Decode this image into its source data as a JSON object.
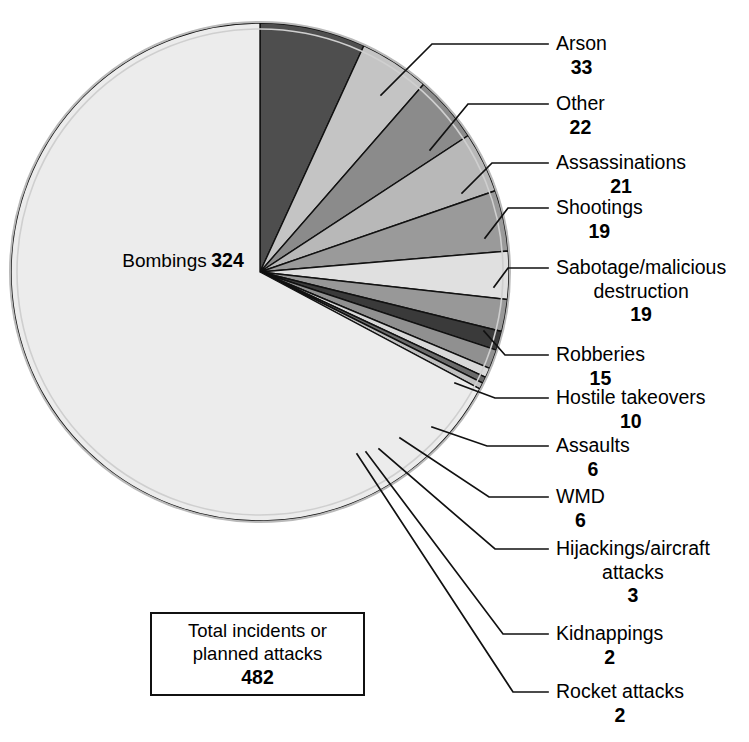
{
  "chart_data": {
    "type": "pie",
    "title": "",
    "total_label_line1": "Total incidents or",
    "total_label_line2": "planned attacks",
    "total_value": "482",
    "categories": [
      "Bombings",
      "Arson",
      "Other",
      "Assassinations",
      "Shootings",
      "Sabotage/malicious destruction",
      "Robberies",
      "Hostile takeovers",
      "Assaults",
      "WMD",
      "Hijackings/aircraft attacks",
      "Kidnappings",
      "Rocket attacks"
    ],
    "values": [
      324,
      33,
      22,
      21,
      19,
      19,
      15,
      10,
      6,
      6,
      3,
      2,
      2
    ],
    "legend_position": "callouts-right",
    "grid": false,
    "slices": [
      {
        "name": "Bombings",
        "value": 324,
        "value_text": "324",
        "color": "#ececec",
        "label_pos": "inside-left"
      },
      {
        "name": "Arson",
        "value": 33,
        "value_text": "33",
        "color": "#4e4e4e",
        "label_pos": "callout-right"
      },
      {
        "name": "Other",
        "value": 22,
        "value_text": "22",
        "color": "#c4c4c4",
        "label_pos": "callout-right"
      },
      {
        "name": "Assassinations",
        "value": 21,
        "value_text": "21",
        "color": "#8b8b8b",
        "label_pos": "callout-right"
      },
      {
        "name": "Shootings",
        "value": 19,
        "value_text": "19",
        "color": "#b8b8b8",
        "label_pos": "callout-right"
      },
      {
        "name": "Sabotage/malicious destruction",
        "value": 19,
        "value_text": "19",
        "color": "#9a9a9a",
        "label_pos": "callout-right"
      },
      {
        "name": "Robberies",
        "value": 15,
        "value_text": "15",
        "color": "#e0e0e0",
        "label_pos": "callout-right"
      },
      {
        "name": "Hostile takeovers",
        "value": 10,
        "value_text": "10",
        "color": "#989898",
        "label_pos": "callout-right"
      },
      {
        "name": "Assaults",
        "value": 6,
        "value_text": "6",
        "color": "#3a3a3a",
        "label_pos": "callout-right"
      },
      {
        "name": "WMD",
        "value": 6,
        "value_text": "6",
        "color": "#909090",
        "label_pos": "callout-right"
      },
      {
        "name": "Hijackings/aircraft attacks",
        "value": 3,
        "value_text": "3",
        "color": "#d8d8d8",
        "label_pos": "callout-right"
      },
      {
        "name": "Kidnappings",
        "value": 2,
        "value_text": "2",
        "color": "#6a6a6a",
        "label_pos": "callout-right"
      },
      {
        "name": "Rocket attacks",
        "value": 2,
        "value_text": "2",
        "color": "#c0c0c0",
        "label_pos": "callout-right"
      }
    ]
  },
  "pie": {
    "bombings_name": "Bombings",
    "bombings_value": "324"
  },
  "callouts": {
    "arson": {
      "name": "Arson",
      "value": "33"
    },
    "other": {
      "name": "Other",
      "value": "22"
    },
    "assassinations": {
      "name": "Assassinations",
      "value": "21"
    },
    "shootings": {
      "name": "Shootings",
      "value": "19"
    },
    "sabotage": {
      "name": "Sabotage/malicious",
      "name2": "destruction",
      "value": "19"
    },
    "robberies": {
      "name": "Robberies",
      "value": "15"
    },
    "hostile": {
      "name": "Hostile takeovers",
      "value": "10"
    },
    "assaults": {
      "name": "Assaults",
      "value": "6"
    },
    "wmd": {
      "name": "WMD",
      "value": "6"
    },
    "hijackings": {
      "name": "Hijackings/aircraft",
      "name2": "attacks",
      "value": "3"
    },
    "kidnappings": {
      "name": "Kidnappings",
      "value": "2"
    },
    "rockets": {
      "name": "Rocket attacks",
      "value": "2"
    }
  },
  "total_box": {
    "line1": "Total incidents or",
    "line2": "planned attacks",
    "value": "482"
  }
}
